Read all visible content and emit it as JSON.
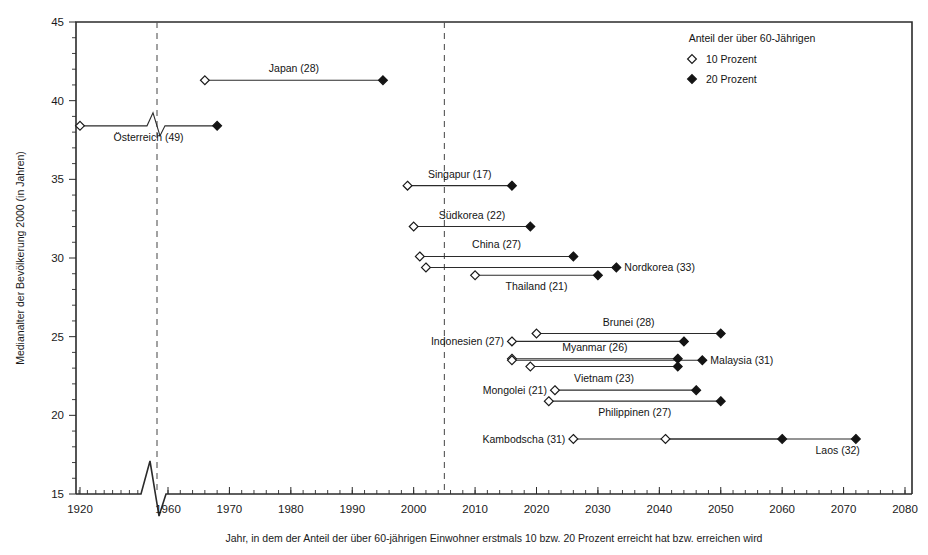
{
  "chart_data": {
    "type": "scatter",
    "title": "",
    "xlabel": "Jahr, in dem der Anteil der über 60-jährigen Einwohner erstmals 10 bzw. 20 Prozent erreicht hat bzw. erreichen wird",
    "ylabel": "Medianalter der Bevölkerung 2000 (in Jahren)",
    "xlim": [
      1920,
      2080
    ],
    "ylim": [
      15,
      45
    ],
    "x_ticks": [
      1920,
      1960,
      1970,
      1980,
      1990,
      2000,
      2010,
      2020,
      2030,
      2040,
      2050,
      2060,
      2070,
      2080
    ],
    "y_ticks": [
      15,
      20,
      25,
      30,
      35,
      40,
      45
    ],
    "x_minor_step": 2,
    "y_minor_step": 1,
    "grid": false,
    "axis_break": {
      "axis": "x",
      "between": [
        1920,
        1960
      ],
      "style": "zigzag"
    },
    "reference_lines": [
      {
        "x": 1935,
        "style": "dashed",
        "label": ""
      },
      {
        "x": 2005,
        "style": "dashed",
        "label": ""
      }
    ],
    "legend": {
      "position": "top-right",
      "title": "Anteil der über 60-Jährigen",
      "entries": [
        {
          "marker": "open-diamond",
          "label": "10 Prozent"
        },
        {
          "marker": "filled-diamond",
          "label": "20 Prozent"
        }
      ]
    },
    "series": [
      {
        "name": "10 Prozent",
        "marker": "open-diamond"
      },
      {
        "name": "20 Prozent",
        "marker": "filled-diamond"
      }
    ],
    "points": [
      {
        "country": "Japan",
        "rank": 28,
        "label": "Japan (28)",
        "median_age": 41.3,
        "year_10pct": 1966,
        "year_20pct": 1995,
        "label_pos": "above-center",
        "break_in_line": false
      },
      {
        "country": "Österreich",
        "rank": 49,
        "label": "Österreich (49)",
        "median_age": 38.4,
        "year_10pct": 1920,
        "year_20pct": 1968,
        "label_pos": "below-center",
        "break_in_line": true
      },
      {
        "country": "Singapur",
        "rank": 17,
        "label": "Singapur (17)",
        "median_age": 34.6,
        "year_10pct": 1999,
        "year_20pct": 2016,
        "label_pos": "above-center",
        "break_in_line": false
      },
      {
        "country": "Südkorea",
        "rank": 22,
        "label": "Südkorea (22)",
        "median_age": 32.0,
        "year_10pct": 2000,
        "year_20pct": 2019,
        "label_pos": "above-center",
        "break_in_line": false
      },
      {
        "country": "China",
        "rank": 27,
        "label": "China (27)",
        "median_age": 30.1,
        "year_10pct": 2001,
        "year_20pct": 2026,
        "label_pos": "above-center",
        "break_in_line": false
      },
      {
        "country": "Nordkorea",
        "rank": 33,
        "label": "Nordkorea (33)",
        "median_age": 29.4,
        "year_10pct": 2002,
        "year_20pct": 2033,
        "label_pos": "right",
        "break_in_line": false
      },
      {
        "country": "Thailand",
        "rank": 21,
        "label": "Thailand (21)",
        "median_age": 28.9,
        "year_10pct": 2010,
        "year_20pct": 2030,
        "label_pos": "below-center",
        "break_in_line": false
      },
      {
        "country": "Brunei",
        "rank": 28,
        "label": "Brunei (28)",
        "median_age": 25.2,
        "year_10pct": 2020,
        "year_20pct": 2050,
        "label_pos": "above-center",
        "break_in_line": false
      },
      {
        "country": "Indonesien",
        "rank": 27,
        "label": "Indonesien (27)",
        "median_age": 24.7,
        "year_10pct": 2016,
        "year_20pct": 2044,
        "label_pos": "left",
        "break_in_line": false
      },
      {
        "country": "Myanmar",
        "rank": 26,
        "label": "Myanmar (26)",
        "median_age": 23.6,
        "year_10pct": 2016,
        "year_20pct": 2043,
        "label_pos": "above-center",
        "break_in_line": false
      },
      {
        "country": "Malaysia",
        "rank": 31,
        "label": "Malaysia (31)",
        "median_age": 23.5,
        "year_10pct": 2016,
        "year_20pct": 2047,
        "label_pos": "right",
        "break_in_line": false
      },
      {
        "country": "Vietnam",
        "rank": 23,
        "label": "Vietnam (23)",
        "median_age": 23.1,
        "year_10pct": 2019,
        "year_20pct": 2043,
        "label_pos": "below-center",
        "break_in_line": false
      },
      {
        "country": "Mongolei",
        "rank": 21,
        "label": "Mongolei (21)",
        "median_age": 21.6,
        "year_10pct": 2023,
        "year_20pct": 2046,
        "label_pos": "left",
        "break_in_line": false
      },
      {
        "country": "Philippinen",
        "rank": 27,
        "label": "Philippinen (27)",
        "median_age": 20.9,
        "year_10pct": 2022,
        "year_20pct": 2050,
        "label_pos": "below-center",
        "break_in_line": false
      },
      {
        "country": "Kambodscha",
        "rank": 31,
        "label": "Kambodscha (31)",
        "median_age": 18.5,
        "year_10pct": 2026,
        "year_20pct": 2060,
        "label_pos": "left",
        "break_in_line": false
      },
      {
        "country": "Laos",
        "rank": 32,
        "label": "Laos (32)",
        "median_age": 18.5,
        "year_10pct": 2041,
        "year_20pct": 2072,
        "label_pos": "below-right",
        "break_in_line": false
      }
    ]
  },
  "colors": {
    "axis": "#2b2b2b",
    "marker_fill": "#141414",
    "marker_open": "#ffffff",
    "refline": "#555555",
    "background": "#ffffff"
  }
}
